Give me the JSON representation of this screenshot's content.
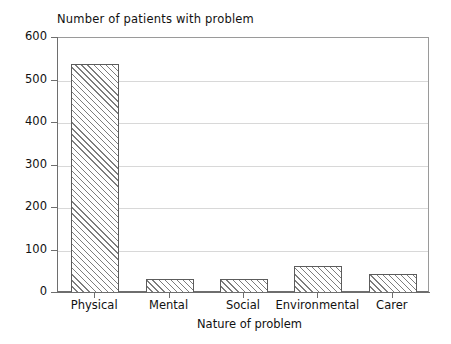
{
  "chart_data": {
    "type": "bar",
    "title": "Number of patients with problem",
    "xlabel": "Nature of problem",
    "ylabel": "",
    "categories": [
      "Physical",
      "Mental",
      "Social",
      "Environmental",
      "Carer"
    ],
    "values": [
      540,
      33,
      33,
      63,
      45
    ],
    "ylim": [
      0,
      600
    ],
    "yticks": [
      0,
      100,
      200,
      300,
      400,
      500,
      600
    ],
    "ytick_labels": [
      "0",
      "100",
      "200",
      "300",
      "400",
      "500",
      "600"
    ],
    "grid": true,
    "legend": "none",
    "bar_fill": "diagonal-hatch",
    "colors": {
      "bar_edge": "#5c5c5c",
      "bar_hatch": "#7d7d7d",
      "axis": "#6e6e6e",
      "gridline": "#d8d8d8",
      "text": "#111111",
      "background": "#ffffff"
    }
  }
}
